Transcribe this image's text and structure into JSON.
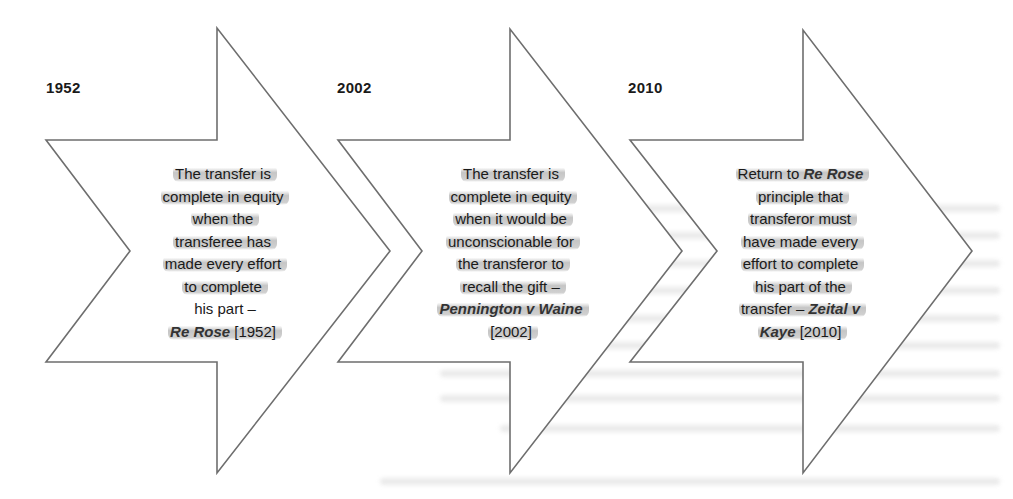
{
  "diagram": {
    "type": "timeline-chevrons",
    "stroke_color": "#6e6e6e",
    "stages": [
      {
        "year": "1952",
        "lines": [
          {
            "text": "The transfer is"
          },
          {
            "text": "complete in equity"
          },
          {
            "text": "when the"
          },
          {
            "text": "transferee has"
          },
          {
            "text": "made every effort"
          },
          {
            "text": "to complete"
          },
          {
            "text": "his part –"
          },
          {
            "case": "Re Rose",
            "text": " [1952]"
          }
        ]
      },
      {
        "year": "2002",
        "lines": [
          {
            "text": "The transfer is"
          },
          {
            "text": "complete in equity"
          },
          {
            "text": "when it would be"
          },
          {
            "text": "unconscionable for"
          },
          {
            "text": "the transferor to"
          },
          {
            "text": "recall the gift –"
          },
          {
            "case": "Pennington v Waine",
            "text": ""
          },
          {
            "text": "[2002]"
          }
        ]
      },
      {
        "year": "2010",
        "lines": [
          {
            "text": "Return to ",
            "case": "Re Rose"
          },
          {
            "text": "principle that"
          },
          {
            "text": "transferor must"
          },
          {
            "text": "have made every"
          },
          {
            "text": "effort to complete"
          },
          {
            "text": "his part of the"
          },
          {
            "text": "transfer – ",
            "case": "Zeital v"
          },
          {
            "case": "Kaye",
            "text": " [2010]"
          }
        ]
      }
    ]
  }
}
